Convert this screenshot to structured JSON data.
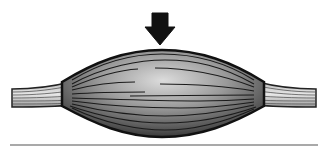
{
  "figure": {
    "elements": {
      "arrow": {
        "direction": "down",
        "color": "#111111"
      },
      "muscle_belly": {
        "fill_light": "#d8d8d8",
        "fill_dark": "#3a3a3a",
        "outline": "#111111"
      },
      "tendons": {
        "count": 2,
        "fill": "#cfcfcf"
      },
      "baseline": {
        "color": "#555555"
      }
    }
  }
}
